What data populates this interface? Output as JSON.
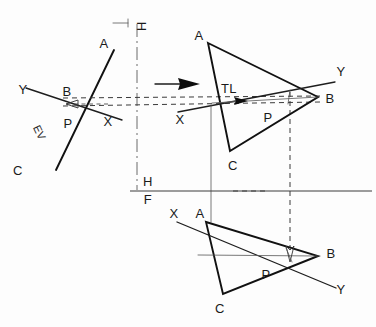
{
  "views": {
    "auxiliary": {
      "name": "edge-view",
      "labels": {
        "A": "A",
        "B": "B",
        "C": "C",
        "P": "P",
        "X": "X",
        "Y": "Y",
        "EV": "EV"
      }
    },
    "top": {
      "name": "top-view",
      "labels": {
        "A": "A",
        "B": "B",
        "C": "C",
        "P": "P",
        "X": "X",
        "Y": "Y",
        "TL": "TL"
      }
    },
    "front": {
      "name": "front-view",
      "labels": {
        "A": "A",
        "B": "B",
        "C": "C",
        "P": "P",
        "X": "X",
        "Y": "Y"
      }
    }
  },
  "fold_lines": {
    "horizontal_label": "H",
    "frontal_label": "F",
    "aux_label": "H"
  },
  "colors": {
    "ink": "#111111",
    "light_ink": "#555555",
    "paper": "#fdfdfd"
  },
  "geometry": {
    "top_triangle": {
      "A": [
        208,
        43
      ],
      "B": [
        318,
        97
      ],
      "C": [
        230,
        151
      ]
    },
    "front_triangle": {
      "A": [
        206,
        222
      ],
      "B": [
        318,
        256
      ],
      "C": [
        223,
        294
      ]
    },
    "aux_line": {
      "A": [
        113,
        52
      ],
      "C": [
        57,
        168
      ]
    },
    "fold_hf_y": 191,
    "fold_aux_x": 137
  }
}
